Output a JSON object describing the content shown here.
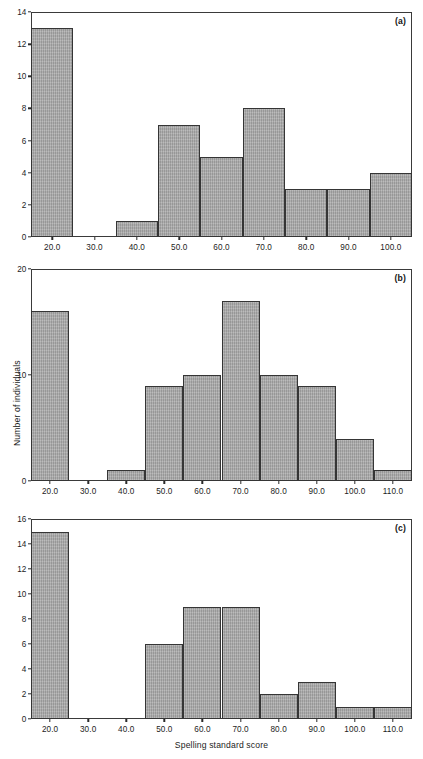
{
  "figure": {
    "xlabel": "Spelling standard score",
    "ylabel": "Number of individuals",
    "bar_color": "#a6a6a6",
    "bar_edge_color": "#353535",
    "axis_color": "#3a3a3a"
  },
  "panels": [
    {
      "letter": "(a)",
      "y_ticks": [
        "0",
        "2",
        "4",
        "6",
        "8",
        "10",
        "12",
        "14"
      ],
      "x_ticks": [
        "20.0",
        "30.0",
        "40.0",
        "50.0",
        "60.0",
        "70.0",
        "80.0",
        "90.0",
        "100.0"
      ],
      "bin_edges": [
        15,
        25,
        35,
        45,
        55,
        65,
        75,
        85,
        95,
        105
      ],
      "bin_centers": [
        20,
        30,
        40,
        50,
        60,
        70,
        80,
        90,
        100
      ],
      "values": [
        13,
        0,
        1,
        7,
        5,
        8,
        3,
        3,
        4
      ],
      "xlim": [
        15,
        105
      ],
      "ylim": [
        0,
        14
      ]
    },
    {
      "letter": "(b)",
      "y_ticks": [
        "0",
        "10",
        "20"
      ],
      "x_ticks": [
        "20.0",
        "30.0",
        "40.0",
        "50.0",
        "60.0",
        "70.0",
        "80.0",
        "90.0",
        "100.0",
        "110.0"
      ],
      "bin_edges": [
        15,
        25,
        35,
        45,
        55,
        65,
        75,
        85,
        95,
        105,
        115
      ],
      "bin_centers": [
        20,
        30,
        40,
        50,
        60,
        70,
        80,
        90,
        100,
        110
      ],
      "values": [
        16,
        0,
        1,
        9,
        10,
        17,
        10,
        9,
        4,
        1
      ],
      "xlim": [
        15,
        115
      ],
      "ylim": [
        0,
        20
      ]
    },
    {
      "letter": "(c)",
      "y_ticks": [
        "0",
        "2",
        "4",
        "6",
        "8",
        "10",
        "12",
        "14",
        "16"
      ],
      "x_ticks": [
        "20.0",
        "30.0",
        "40.0",
        "50.0",
        "60.0",
        "70.0",
        "80.0",
        "90.0",
        "100.0",
        "110.0"
      ],
      "bin_edges": [
        15,
        25,
        35,
        45,
        55,
        65,
        75,
        85,
        95,
        105,
        115
      ],
      "bin_centers": [
        20,
        30,
        40,
        50,
        60,
        70,
        80,
        90,
        100,
        110
      ],
      "values": [
        15,
        0,
        0,
        6,
        9,
        9,
        2,
        3,
        1,
        1
      ],
      "xlim": [
        15,
        115
      ],
      "ylim": [
        0,
        16
      ]
    }
  ],
  "chart_data": {
    "type": "bar",
    "title": "",
    "subtitle": "",
    "xlabel": "Spelling standard score",
    "ylabel": "Number of individuals",
    "grid": false,
    "legend": null,
    "panel_layout": "3 stacked histogram panels (a), (b), (c) sharing x-axis",
    "panels": [
      {
        "label": "(a)",
        "type": "bar",
        "categories": [
          "20.0",
          "30.0",
          "40.0",
          "50.0",
          "60.0",
          "70.0",
          "80.0",
          "90.0",
          "100.0"
        ],
        "bin_edges": [
          15,
          25,
          35,
          45,
          55,
          65,
          75,
          85,
          95,
          105
        ],
        "values": [
          13,
          0,
          1,
          7,
          5,
          8,
          3,
          3,
          4
        ],
        "xlim": [
          15,
          105
        ],
        "ylim": [
          0,
          14
        ],
        "ytick_values": [
          0,
          2,
          4,
          6,
          8,
          10,
          12,
          14
        ],
        "xlabel": "",
        "ylabel": ""
      },
      {
        "label": "(b)",
        "type": "bar",
        "categories": [
          "20.0",
          "30.0",
          "40.0",
          "50.0",
          "60.0",
          "70.0",
          "80.0",
          "90.0",
          "100.0",
          "110.0"
        ],
        "bin_edges": [
          15,
          25,
          35,
          45,
          55,
          65,
          75,
          85,
          95,
          105,
          115
        ],
        "values": [
          16,
          0,
          1,
          9,
          10,
          17,
          10,
          9,
          4,
          1
        ],
        "xlim": [
          15,
          115
        ],
        "ylim": [
          0,
          20
        ],
        "ytick_values": [
          0,
          10,
          20
        ],
        "xlabel": "",
        "ylabel": "Number of individuals"
      },
      {
        "label": "(c)",
        "type": "bar",
        "categories": [
          "20.0",
          "30.0",
          "40.0",
          "50.0",
          "60.0",
          "70.0",
          "80.0",
          "90.0",
          "100.0",
          "110.0"
        ],
        "bin_edges": [
          15,
          25,
          35,
          45,
          55,
          65,
          75,
          85,
          95,
          105,
          115
        ],
        "values": [
          15,
          0,
          0,
          6,
          9,
          9,
          2,
          3,
          1,
          1
        ],
        "xlim": [
          15,
          115
        ],
        "ylim": [
          0,
          16
        ],
        "ytick_values": [
          0,
          2,
          4,
          6,
          8,
          10,
          12,
          14,
          16
        ],
        "xlabel": "Spelling standard score",
        "ylabel": ""
      }
    ]
  }
}
